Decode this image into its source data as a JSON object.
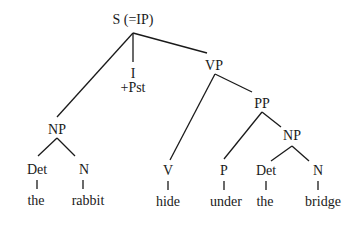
{
  "diagram": {
    "type": "syntax-tree",
    "nodes": {
      "root": {
        "label": "S (=IP)"
      },
      "infl": {
        "label": "I",
        "feature": "+Pst"
      },
      "vp": {
        "label": "VP"
      },
      "subject_np": {
        "label": "NP"
      },
      "subject_det": {
        "label": "Det",
        "word": "the"
      },
      "subject_n": {
        "label": "N",
        "word": "rabbit"
      },
      "verb": {
        "label": "V",
        "word": "hide"
      },
      "pp": {
        "label": "PP"
      },
      "prep": {
        "label": "P",
        "word": "under"
      },
      "object_np": {
        "label": "NP"
      },
      "object_det": {
        "label": "Det",
        "word": "the"
      },
      "object_n": {
        "label": "N",
        "word": "bridge"
      }
    },
    "edges": [
      [
        "root",
        "subject_np"
      ],
      [
        "root",
        "infl"
      ],
      [
        "root",
        "vp"
      ],
      [
        "subject_np",
        "subject_det"
      ],
      [
        "subject_np",
        "subject_n"
      ],
      [
        "vp",
        "verb"
      ],
      [
        "vp",
        "pp"
      ],
      [
        "pp",
        "prep"
      ],
      [
        "pp",
        "object_np"
      ],
      [
        "object_np",
        "object_det"
      ],
      [
        "object_np",
        "object_n"
      ]
    ],
    "sentence": [
      "the",
      "rabbit",
      "hide",
      "under",
      "the",
      "bridge"
    ]
  }
}
